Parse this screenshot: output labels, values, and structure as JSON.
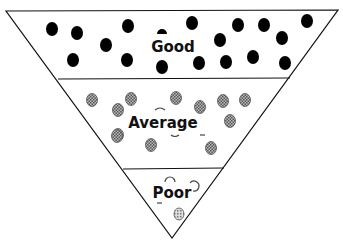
{
  "diagram": {
    "type": "inverted-triangle",
    "colors": {
      "outline": "#111111",
      "dot_good": "#000000",
      "dot_average": "#888888",
      "dot_poor": "#aaaaaa",
      "background": "#ffffff"
    },
    "sections": [
      {
        "label": "Good",
        "dot_style": "solid-black",
        "dots": [
          [
            52,
            29
          ],
          [
            77,
            33
          ],
          [
            106,
            45
          ],
          [
            73,
            60
          ],
          [
            128,
            26
          ],
          [
            127,
            60
          ],
          [
            162,
            67
          ],
          [
            192,
            23
          ],
          [
            220,
            40
          ],
          [
            199,
            63
          ],
          [
            226,
            62
          ],
          [
            238,
            25
          ],
          [
            253,
            57
          ],
          [
            264,
            25
          ],
          [
            282,
            38
          ],
          [
            285,
            63
          ],
          [
            307,
            21
          ]
        ]
      },
      {
        "label": "Average",
        "dot_style": "gray-hatched",
        "dots": [
          [
            92,
            100
          ],
          [
            131,
            99
          ],
          [
            176,
            98
          ],
          [
            118,
            110
          ],
          [
            200,
            107
          ],
          [
            223,
            101
          ],
          [
            245,
            100
          ],
          [
            118,
            135
          ],
          [
            230,
            121
          ],
          [
            117,
            136
          ],
          [
            151,
            145
          ],
          [
            211,
            148
          ]
        ]
      },
      {
        "label": "Poor",
        "dot_style": "light-hatched",
        "dots": [
          [
            179,
            214
          ]
        ]
      }
    ]
  }
}
